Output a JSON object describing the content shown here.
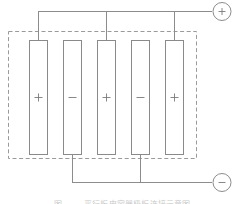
{
  "figure": {
    "type": "electrical-schematic",
    "caption": "图 —— 平行板电容器极板连接示意图",
    "caption_visible": "clipped"
  },
  "colors": {
    "line": "#8c8c8c",
    "plate_stroke": "#8a8a8a",
    "plate_fill": "#ffffff",
    "dashed_boundary": "#9a9a9a",
    "terminal_stroke": "#8c8c8c",
    "sign_glyph": "#7a7a7a",
    "background": "#ffffff",
    "caption_text": "#c9c9c9"
  },
  "enclosure": {
    "label": "dielectric-enclosure",
    "style": "dashed",
    "x": 8,
    "y": 31,
    "width": 188,
    "height": 127
  },
  "plates": [
    {
      "id": 1,
      "sign": "+",
      "polarity": "positive",
      "x": 29,
      "bus": "top"
    },
    {
      "id": 2,
      "sign": "−",
      "polarity": "negative",
      "x": 63,
      "bus": "bottom"
    },
    {
      "id": 3,
      "sign": "+",
      "polarity": "positive",
      "x": 97,
      "bus": "top"
    },
    {
      "id": 4,
      "sign": "−",
      "polarity": "negative",
      "x": 131,
      "bus": "bottom"
    },
    {
      "id": 5,
      "sign": "+",
      "polarity": "positive",
      "x": 165,
      "bus": "top"
    }
  ],
  "plate_geometry": {
    "width": 18,
    "top": 40,
    "bottom": 155,
    "height": 115
  },
  "buses": {
    "top": {
      "label": "positive-bus",
      "y": 11,
      "x_start": 38,
      "x_end": 210,
      "connects_plates": [
        1,
        3,
        5
      ]
    },
    "bottom": {
      "label": "negative-bus",
      "y": 182,
      "x_start": 72,
      "x_end": 210,
      "connects_plates": [
        2,
        4
      ]
    }
  },
  "terminals": [
    {
      "id": "positive-terminal",
      "sign": "+",
      "cx": 222,
      "cy": 11,
      "r": 9
    },
    {
      "id": "negative-terminal",
      "sign": "−",
      "cx": 222,
      "cy": 182,
      "r": 9
    }
  ]
}
